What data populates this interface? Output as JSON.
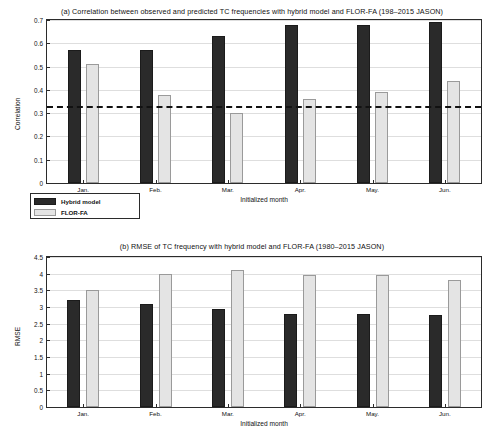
{
  "figure": {
    "panel_a_title": "(a) Correlation between observed and predicted TC frequencies with hybrid model and FLOR-FA (198–2015 JASON)",
    "panel_b_title": "(b) RMSE of TC frequency with hybrid model and FLOR-FA (1980–2015 JASON)",
    "legend": {
      "series1": "Hybrid model",
      "series2": "FLOR-FA"
    },
    "colors": {
      "hybrid_model": "#2a2a2a",
      "flor_fa": "#e4e4e4",
      "axis": "#2b2b2b",
      "grid": "#dedede",
      "threshold_line": "#111111"
    }
  },
  "chart_data": [
    {
      "type": "bar",
      "title": "(a) Correlation between observed and predicted TC frequencies with hybrid model and FLOR-FA (198–2015 JASON)",
      "xlabel": "Initialized month",
      "ylabel": "Correlation",
      "categories": [
        "Jan.",
        "Feb.",
        "Mar.",
        "Apr.",
        "May.",
        "Jun."
      ],
      "ylim": [
        0,
        0.7
      ],
      "yticks": [
        0,
        0.1,
        0.2,
        0.3,
        0.4,
        0.5,
        0.6,
        0.7
      ],
      "ytick_labels": [
        "0",
        "0.1",
        "0.2",
        "0.3",
        "0.4",
        "0.5",
        "0.6",
        "0.7"
      ],
      "grid": true,
      "legend_position": "below-left",
      "series": [
        {
          "name": "Hybrid model",
          "values": [
            0.57,
            0.57,
            0.63,
            0.68,
            0.68,
            0.69
          ]
        },
        {
          "name": "FLOR-FA",
          "values": [
            0.51,
            0.38,
            0.3,
            0.36,
            0.39,
            0.44
          ]
        }
      ],
      "annotations": [
        {
          "type": "hline",
          "value": 0.33,
          "style": "dashed",
          "label": "significance threshold"
        }
      ]
    },
    {
      "type": "bar",
      "title": "(b) RMSE of TC frequency with hybrid model and FLOR-FA (1980–2015 JASON)",
      "xlabel": "Initialized month",
      "ylabel": "RMSE",
      "categories": [
        "Jan.",
        "Feb.",
        "Mar.",
        "Apr.",
        "May.",
        "Jun."
      ],
      "ylim": [
        0,
        4.5
      ],
      "yticks": [
        0,
        0.5,
        1,
        1.5,
        2,
        2.5,
        3,
        3.5,
        4,
        4.5
      ],
      "ytick_labels": [
        "0",
        "0.5",
        "1",
        "1.5",
        "2",
        "2.5",
        "3",
        "3.5",
        "4",
        "4.5"
      ],
      "grid": true,
      "series": [
        {
          "name": "Hybrid model",
          "values": [
            3.2,
            3.1,
            2.95,
            2.8,
            2.78,
            2.75
          ]
        },
        {
          "name": "FLOR-FA",
          "values": [
            3.5,
            4.0,
            4.1,
            3.95,
            3.95,
            3.8
          ]
        }
      ]
    }
  ]
}
